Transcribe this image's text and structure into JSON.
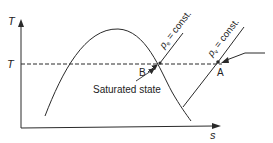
{
  "diagram": {
    "type": "T-s diagram",
    "axes": {
      "y_label": "T",
      "x_label": "s"
    },
    "isotherm_label": "T",
    "lines": {
      "pe_label": "p",
      "pe_sub": "e",
      "pe_rest": " = const.",
      "pv_label": "p",
      "pv_sub": "v",
      "pv_rest": " = const."
    },
    "points": {
      "A": "A",
      "B": "B"
    },
    "annotation": "Saturated state",
    "colors": {
      "line": "#2a2a2a",
      "background": "#ffffff"
    }
  }
}
